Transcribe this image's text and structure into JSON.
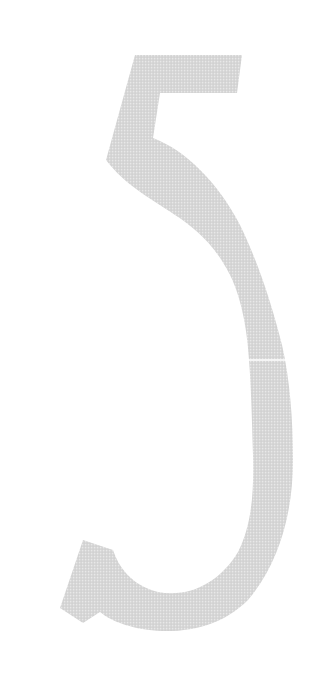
{
  "glyph": {
    "character": "5",
    "fill_color": "#d6d6d6",
    "dot_color": "#e8e8e8",
    "grid_color": "#c8c8c8",
    "seam_color": "#ffffff",
    "background_color": "#ffffff"
  }
}
